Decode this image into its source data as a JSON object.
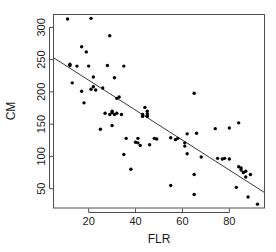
{
  "chart_data": {
    "type": "scatter",
    "title": "",
    "xlabel": "FLR",
    "ylabel": "CM",
    "xlim": [
      5,
      95
    ],
    "ylim": [
      20,
      320
    ],
    "xticks": [
      20,
      40,
      60,
      80
    ],
    "yticks": [
      50,
      100,
      150,
      200,
      250,
      300
    ],
    "grid": false,
    "legend": null,
    "point_color": "#000000",
    "line_color": "#3a3a3a",
    "box_color": "#4d4d4d",
    "trend_line": {
      "label": "fitted regression line",
      "x_start": 5,
      "y_start": 253,
      "x_end": 95,
      "y_end": 44,
      "slope": -2.32,
      "intercept": 264.6
    },
    "x": [
      11,
      12,
      12,
      13,
      15,
      17,
      17,
      18,
      19,
      20,
      21,
      21,
      22,
      22,
      23,
      25,
      26,
      27,
      28,
      29,
      29,
      30,
      30,
      30,
      31,
      31,
      32,
      32,
      33,
      34,
      35,
      35,
      36,
      38,
      40,
      41,
      41,
      42,
      43,
      43,
      44,
      45,
      45,
      45,
      45,
      46,
      48,
      49,
      55,
      55,
      57,
      58,
      61,
      61,
      62,
      62,
      65,
      65,
      65,
      66,
      68,
      74,
      75,
      77,
      78,
      80,
      80,
      83,
      84,
      84,
      85,
      85,
      86,
      87,
      87,
      88,
      89,
      92
    ],
    "y": [
      313,
      241,
      243,
      214,
      240,
      201,
      270,
      183,
      262,
      240,
      314,
      204,
      223,
      208,
      203,
      142,
      206,
      167,
      241,
      287,
      165,
      170,
      168,
      148,
      222,
      165,
      190,
      167,
      192,
      165,
      103,
      240,
      128,
      80,
      122,
      121,
      128,
      117,
      162,
      165,
      176,
      170,
      166,
      163,
      162,
      118,
      128,
      127,
      55,
      129,
      126,
      128,
      116,
      121,
      104,
      135,
      72,
      198,
      41,
      136,
      99,
      143,
      97,
      96,
      97,
      144,
      96,
      52,
      152,
      84,
      82,
      79,
      75,
      77,
      68,
      37,
      72,
      26
    ]
  },
  "figure": {
    "background": "#ffffff",
    "axis_title_x": "FLR",
    "axis_title_y": "CM"
  }
}
